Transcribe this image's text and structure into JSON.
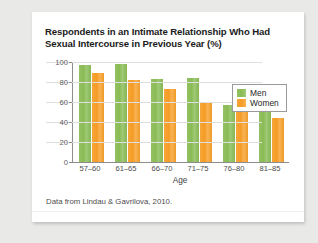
{
  "card": {
    "title": "Respondents in an Intimate Relationship Who Had Sexual Intercourse in Previous Year (%)",
    "source": "Data from Lindau & Gavrilova, 2010."
  },
  "colors": {
    "men": "#8CBF5A",
    "women": "#F5A030",
    "axis": "#8D8D8D",
    "grid": "#DEDEDE",
    "card_background": "#FFFFFF",
    "page_background": "#E9E9E7",
    "title_text": "#1B1B1B"
  },
  "chart_data": {
    "type": "bar",
    "title": "Respondents in an Intimate Relationship Who Had Sexual Intercourse in Previous Year (%)",
    "xlabel": "Age",
    "ylabel": "",
    "ylim": [
      0,
      100
    ],
    "yticks": [
      0,
      20,
      40,
      60,
      80,
      100
    ],
    "ytick_labels": [
      "0",
      "20",
      "40",
      "60",
      "80",
      "100"
    ],
    "grid": true,
    "legend_position": "top-right",
    "categories": [
      "57–60",
      "61–65",
      "66–70",
      "71–75",
      "76–80",
      "81–85"
    ],
    "series": [
      {
        "name": "Men",
        "color": "#8CBF5A",
        "values": [
          97,
          98,
          83,
          84,
          57,
          55
        ]
      },
      {
        "name": "Women",
        "color": "#F5A030",
        "values": [
          89,
          82,
          73,
          59,
          60,
          44
        ]
      }
    ]
  }
}
